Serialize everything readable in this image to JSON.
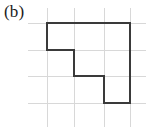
{
  "figure": {
    "label": "(b)",
    "caption_position": "top-left",
    "background_color": "#ffffff",
    "width": 146,
    "height": 127
  },
  "grid": {
    "visible": true,
    "color": "#d8d8d8",
    "line_width": 1,
    "cell_width": 27,
    "cell_height": 27,
    "vertical_lines_x": [
      47,
      74,
      104,
      130
    ],
    "horizontal_lines_y": [
      23,
      50,
      76,
      103
    ],
    "extent": {
      "x_min": 28,
      "x_max": 146,
      "y_min": 8,
      "y_max": 127
    }
  },
  "chart_data": {
    "type": "scatter",
    "title": "(b)",
    "subtitle": "",
    "xlabel": "",
    "ylabel": "",
    "xlim": [
      0,
      4
    ],
    "ylim": [
      0,
      4
    ],
    "grid": true,
    "legend": "none",
    "shape": {
      "name": "staircase-polygon",
      "stroke_color": "#3a3a3a",
      "stroke_width": 2,
      "fill": "none",
      "closed": true,
      "area_grid_units": 10,
      "perimeter_grid_units": 16,
      "vertices_grid": [
        [
          0,
          3
        ],
        [
          3,
          3
        ],
        [
          3,
          0
        ],
        [
          2,
          0
        ],
        [
          2,
          1
        ],
        [
          1,
          1
        ],
        [
          1,
          2
        ],
        [
          0,
          2
        ]
      ],
      "vertices_px": [
        [
          47,
          23
        ],
        [
          130,
          23
        ],
        [
          130,
          103
        ],
        [
          104,
          103
        ],
        [
          104,
          76
        ],
        [
          74,
          76
        ],
        [
          74,
          50
        ],
        [
          47,
          50
        ]
      ],
      "path_d": "M 47 23 L 130 23 L 130 103 L 104 103 L 104 76 L 74 76 L 74 50 L 47 50 Z"
    }
  }
}
